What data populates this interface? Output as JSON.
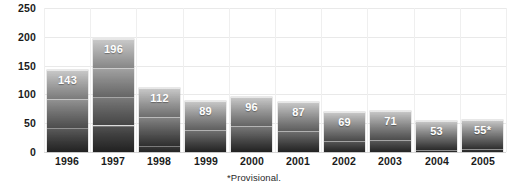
{
  "chart_data": {
    "type": "bar",
    "title": "",
    "subtitle": "",
    "xlabel": "",
    "ylabel": "",
    "categories": [
      "1996",
      "1997",
      "1998",
      "1999",
      "2000",
      "2001",
      "2002",
      "2003",
      "2004",
      "2005"
    ],
    "values": [
      143,
      196,
      112,
      89,
      96,
      87,
      69,
      71,
      53,
      55
    ],
    "value_labels": [
      "143",
      "196",
      "112",
      "89",
      "96",
      "87",
      "69",
      "71",
      "53",
      "55*"
    ],
    "ylim": [
      0,
      250
    ],
    "yticks": [
      250,
      200,
      150,
      100,
      50,
      0
    ],
    "ytick_labels": [
      "250",
      "200",
      "150",
      "100",
      "50",
      "0"
    ],
    "grid": "both",
    "legend": "none",
    "annotations": [
      "*Provisional."
    ],
    "series": [
      {
        "name": "",
        "values": [
          143,
          196,
          112,
          89,
          96,
          87,
          69,
          71,
          53,
          55
        ]
      }
    ]
  },
  "footnote": {
    "text": "*Provisional."
  },
  "colors": {
    "bar_top": "#c9c9c9",
    "bar_bottom": "#272727",
    "value_label": "#ffffff",
    "axis_text": "#1b1b1b",
    "gridline": "#e9e9e9",
    "background": "#ffffff"
  }
}
